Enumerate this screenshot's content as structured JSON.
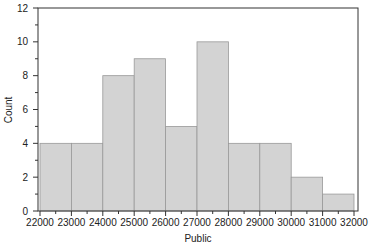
{
  "chart_data": {
    "type": "bar",
    "subtype": "histogram",
    "title": "",
    "xlabel": "Public",
    "ylabel": "Count",
    "bin_edges": [
      22000,
      23000,
      24000,
      25000,
      26000,
      27000,
      28000,
      29000,
      30000,
      31000,
      32000
    ],
    "categories": [
      "22000-23000",
      "23000-24000",
      "24000-25000",
      "25000-26000",
      "26000-27000",
      "27000-28000",
      "28000-29000",
      "29000-30000",
      "30000-31000",
      "31000-32000"
    ],
    "values": [
      4,
      4,
      8,
      9,
      5,
      10,
      4,
      4,
      2,
      1
    ],
    "xlim": [
      22000,
      32000
    ],
    "ylim": [
      0,
      12
    ],
    "x_ticks": [
      "22000",
      "23000",
      "24000",
      "25000",
      "26000",
      "27000",
      "28000",
      "29000",
      "30000",
      "31000",
      "32000"
    ],
    "y_ticks": [
      "0",
      "2",
      "4",
      "6",
      "8",
      "10",
      "12"
    ],
    "grid": false,
    "legend": null,
    "bar_color": "#d3d3d3",
    "bar_edge_color": "#999999"
  }
}
